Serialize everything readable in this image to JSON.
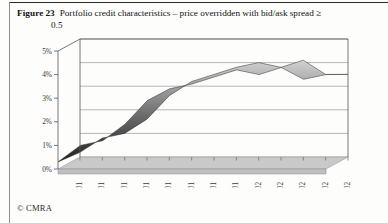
{
  "figure": {
    "label": "Figure",
    "number": "23",
    "caption_line1": "Portfolio credit characteristics – price overridden with bid/ask spread ≥",
    "caption_line2": "0.5"
  },
  "footer": {
    "copyright": "© CMRA"
  },
  "chart_data": {
    "type": "area",
    "title": "Portfolio credit characteristics – price overridden with bid/ask spread ≥ 0.5",
    "xlabel": "",
    "ylabel": "",
    "categories": [
      "5/01",
      "6/01",
      "7/01",
      "8/01",
      "9/01",
      "10/01",
      "11/01",
      "12/01",
      "1/02",
      "2/02",
      "3/02",
      "4/02",
      "5/02"
    ],
    "values": [
      0.3,
      1.0,
      1.2,
      1.9,
      2.9,
      3.4,
      3.6,
      3.9,
      4.2,
      4.0,
      4.3,
      3.8,
      4.0
    ],
    "values_back": [
      0.2,
      0.8,
      1.0,
      1.6,
      2.6,
      3.2,
      3.5,
      3.8,
      4.0,
      3.8,
      4.1,
      3.5,
      3.5
    ],
    "ylim": [
      0,
      5
    ],
    "yticks": [
      "0%",
      "1%",
      "2%",
      "3%",
      "4%",
      "5%"
    ],
    "ytick_values": [
      0,
      1,
      2,
      3,
      4,
      5
    ],
    "grid": true,
    "legend": "none",
    "style": "3d-ribbon",
    "series_color": "#3d3d3d",
    "grid_color": "#9a9a9a",
    "floor_color": "#c9c9c9"
  }
}
